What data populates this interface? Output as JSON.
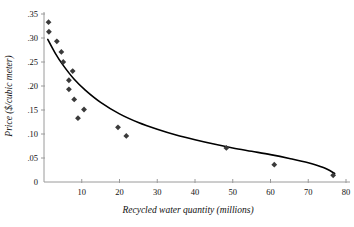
{
  "chart_data": {
    "type": "scatter",
    "title": "",
    "xlabel": "Recycled water quantity (millions)",
    "ylabel": "Price ($/cubic meter)",
    "xlim": [
      0,
      80
    ],
    "ylim": [
      0,
      0.35
    ],
    "xticks": [
      0,
      10,
      20,
      30,
      40,
      50,
      60,
      70,
      80
    ],
    "xtick_labels": [
      "0",
      "10",
      "20",
      "30",
      "40",
      "50",
      "60",
      "70",
      "80"
    ],
    "yticks": [
      0,
      0.05,
      0.1,
      0.15,
      0.2,
      0.25,
      0.3,
      0.35
    ],
    "ytick_labels": [
      "0",
      ".05",
      ".10",
      ".15",
      ".20",
      ".25",
      ".30",
      ".35"
    ],
    "grid": false,
    "legend": "none",
    "marker": "diamond",
    "marker_color": "#3a3a3a",
    "curve_color": "#000000",
    "axis_color": "#9a9a9a",
    "points": [
      {
        "x": 1.2,
        "y": 0.333
      },
      {
        "x": 1.3,
        "y": 0.313
      },
      {
        "x": 3.4,
        "y": 0.293
      },
      {
        "x": 4.6,
        "y": 0.271
      },
      {
        "x": 5.1,
        "y": 0.25
      },
      {
        "x": 7.6,
        "y": 0.231
      },
      {
        "x": 6.6,
        "y": 0.212
      },
      {
        "x": 6.6,
        "y": 0.193
      },
      {
        "x": 8.0,
        "y": 0.172
      },
      {
        "x": 10.6,
        "y": 0.151
      },
      {
        "x": 9.0,
        "y": 0.133
      },
      {
        "x": 19.6,
        "y": 0.114
      },
      {
        "x": 21.8,
        "y": 0.096
      },
      {
        "x": 48.3,
        "y": 0.071
      },
      {
        "x": 61.0,
        "y": 0.036
      },
      {
        "x": 76.6,
        "y": 0.014
      }
    ],
    "fit_curve": {
      "description": "decaying power fit",
      "points": [
        {
          "x": 1.0,
          "y": 0.297
        },
        {
          "x": 3.0,
          "y": 0.268
        },
        {
          "x": 5.0,
          "y": 0.244
        },
        {
          "x": 8.0,
          "y": 0.214
        },
        {
          "x": 11.0,
          "y": 0.191
        },
        {
          "x": 15.0,
          "y": 0.166
        },
        {
          "x": 20.0,
          "y": 0.142
        },
        {
          "x": 25.0,
          "y": 0.124
        },
        {
          "x": 30.0,
          "y": 0.11
        },
        {
          "x": 35.0,
          "y": 0.098
        },
        {
          "x": 40.0,
          "y": 0.088
        },
        {
          "x": 45.0,
          "y": 0.079
        },
        {
          "x": 50.0,
          "y": 0.071
        },
        {
          "x": 55.0,
          "y": 0.064
        },
        {
          "x": 60.0,
          "y": 0.057
        },
        {
          "x": 65.0,
          "y": 0.049
        },
        {
          "x": 70.0,
          "y": 0.04
        },
        {
          "x": 74.0,
          "y": 0.03
        },
        {
          "x": 77.0,
          "y": 0.018
        }
      ]
    }
  }
}
